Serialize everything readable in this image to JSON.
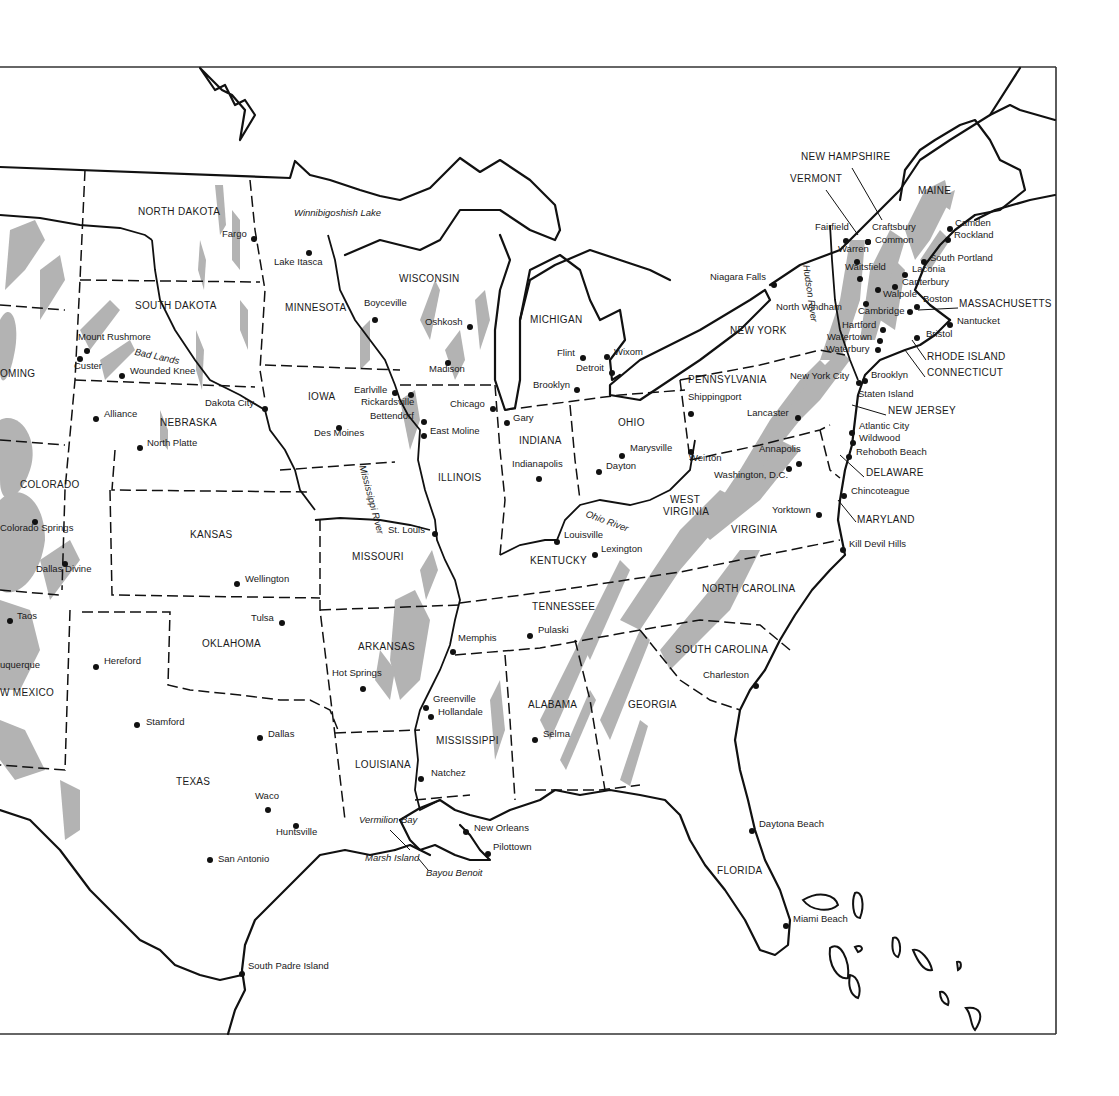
{
  "map": {
    "title_visible": false,
    "colors": {
      "line": "#111111",
      "mountain_shading": "#b3b3b3",
      "background": "#ffffff"
    },
    "states": [
      {
        "name": "NORTH DAKOTA",
        "x": 138,
        "y": 212
      },
      {
        "name": "SOUTH DAKOTA",
        "x": 135,
        "y": 306
      },
      {
        "name": "OMING",
        "x": 0,
        "y": 374
      },
      {
        "name": "NEBRASKA",
        "x": 160,
        "y": 423
      },
      {
        "name": "COLORADO",
        "x": 20,
        "y": 485
      },
      {
        "name": "KANSAS",
        "x": 190,
        "y": 535
      },
      {
        "name": "OKLAHOMA",
        "x": 202,
        "y": 644
      },
      {
        "name": "W MEXICO",
        "x": 0,
        "y": 693
      },
      {
        "name": "TEXAS",
        "x": 176,
        "y": 782
      },
      {
        "name": "MINNESOTA",
        "x": 285,
        "y": 308
      },
      {
        "name": "WISCONSIN",
        "x": 399,
        "y": 279
      },
      {
        "name": "IOWA",
        "x": 308,
        "y": 397
      },
      {
        "name": "ILLINOIS",
        "x": 438,
        "y": 478
      },
      {
        "name": "MISSOURI",
        "x": 352,
        "y": 557
      },
      {
        "name": "ARKANSAS",
        "x": 358,
        "y": 647
      },
      {
        "name": "LOUISIANA",
        "x": 355,
        "y": 765
      },
      {
        "name": "MISSISSIPPI",
        "x": 436,
        "y": 741
      },
      {
        "name": "ALABAMA",
        "x": 528,
        "y": 705
      },
      {
        "name": "TENNESSEE",
        "x": 532,
        "y": 607
      },
      {
        "name": "KENTUCKY",
        "x": 530,
        "y": 561
      },
      {
        "name": "INDIANA",
        "x": 519,
        "y": 441
      },
      {
        "name": "MICHIGAN",
        "x": 530,
        "y": 320
      },
      {
        "name": "OHIO",
        "x": 618,
        "y": 423
      },
      {
        "name": "WEST",
        "x": 670,
        "y": 500
      },
      {
        "name": "VIRGINIA",
        "x": 663,
        "y": 512
      },
      {
        "name": "VIRGINIA",
        "x": 731,
        "y": 530
      },
      {
        "name": "GEORGIA",
        "x": 628,
        "y": 705
      },
      {
        "name": "SOUTH CAROLINA",
        "x": 675,
        "y": 650
      },
      {
        "name": "NORTH CAROLINA",
        "x": 702,
        "y": 589
      },
      {
        "name": "FLORIDA",
        "x": 717,
        "y": 871
      },
      {
        "name": "PENNSYLVANIA",
        "x": 688,
        "y": 380
      },
      {
        "name": "NEW YORK",
        "x": 730,
        "y": 331
      },
      {
        "name": "MAINE",
        "x": 918,
        "y": 191
      },
      {
        "name": "NEW HAMPSHIRE",
        "x": 801,
        "y": 157
      },
      {
        "name": "VERMONT",
        "x": 790,
        "y": 179
      },
      {
        "name": "MASSACHUSETTS",
        "x": 959,
        "y": 304
      },
      {
        "name": "RHODE ISLAND",
        "x": 927,
        "y": 357
      },
      {
        "name": "CONNECTICUT",
        "x": 927,
        "y": 373
      },
      {
        "name": "NEW JERSEY",
        "x": 888,
        "y": 411
      },
      {
        "name": "DELAWARE",
        "x": 866,
        "y": 473
      },
      {
        "name": "MARYLAND",
        "x": 857,
        "y": 520
      }
    ],
    "cities": [
      {
        "name": "Fargo",
        "dx": 254,
        "dy": 239,
        "lx": 222,
        "ly": 234
      },
      {
        "name": "Lake Itasca",
        "dx": 309,
        "dy": 253,
        "lx": 274,
        "ly": 262
      },
      {
        "name": "Mount Rushmore",
        "dx": 87,
        "dy": 351,
        "lx": 78,
        "ly": 337
      },
      {
        "name": "Custer",
        "dx": 80,
        "dy": 359,
        "lx": 74,
        "ly": 366
      },
      {
        "name": "Wounded Knee",
        "dx": 122,
        "dy": 376,
        "lx": 130,
        "ly": 371
      },
      {
        "name": "Alliance",
        "dx": 96,
        "dy": 419,
        "lx": 104,
        "ly": 414
      },
      {
        "name": "North Platte",
        "dx": 140,
        "dy": 448,
        "lx": 147,
        "ly": 443
      },
      {
        "name": "Dakota City",
        "dx": 265,
        "dy": 409,
        "lx": 205,
        "ly": 403
      },
      {
        "name": "Colorado Springs",
        "dx": 35,
        "dy": 522,
        "lx": 0,
        "ly": 528
      },
      {
        "name": "Dallas Divine",
        "dx": 65,
        "dy": 564,
        "lx": 36,
        "ly": 569
      },
      {
        "name": "Wellington",
        "dx": 237,
        "dy": 584,
        "lx": 245,
        "ly": 579
      },
      {
        "name": "Taos",
        "dx": 10,
        "dy": 621,
        "lx": 17,
        "ly": 616
      },
      {
        "name": "uquerque",
        "dx": -20,
        "dy": -20,
        "lx": 0,
        "ly": 665
      },
      {
        "name": "Tulsa",
        "dx": 282,
        "dy": 623,
        "lx": 251,
        "ly": 618
      },
      {
        "name": "Hereford",
        "dx": 96,
        "dy": 667,
        "lx": 104,
        "ly": 661
      },
      {
        "name": "Stamford",
        "dx": 137,
        "dy": 725,
        "lx": 146,
        "ly": 722
      },
      {
        "name": "Dallas",
        "dx": 260,
        "dy": 738,
        "lx": 268,
        "ly": 734
      },
      {
        "name": "Waco",
        "dx": 268,
        "dy": 810,
        "lx": 255,
        "ly": 796
      },
      {
        "name": "Huntsville",
        "dx": 296,
        "dy": 826,
        "lx": 276,
        "ly": 832
      },
      {
        "name": "San Antonio",
        "dx": 210,
        "dy": 860,
        "lx": 218,
        "ly": 859
      },
      {
        "name": "South Padre Island",
        "dx": 242,
        "dy": 974,
        "lx": 248,
        "ly": 966
      },
      {
        "name": "Boyceville",
        "dx": 375,
        "dy": 320,
        "lx": 364,
        "ly": 303
      },
      {
        "name": "Oshkosh",
        "dx": 470,
        "dy": 327,
        "lx": 425,
        "ly": 322
      },
      {
        "name": "Madison",
        "dx": 448,
        "dy": 363,
        "lx": 429,
        "ly": 369
      },
      {
        "name": "Earlville",
        "dx": 395,
        "dy": 393,
        "lx": 354,
        "ly": 390
      },
      {
        "name": "Rickardsville",
        "dx": 411,
        "dy": 395,
        "lx": 361,
        "ly": 402
      },
      {
        "name": "Bettendorf",
        "dx": 424,
        "dy": 422,
        "lx": 370,
        "ly": 416
      },
      {
        "name": "East Moline",
        "dx": 424,
        "dy": 436,
        "lx": 430,
        "ly": 431
      },
      {
        "name": "Des Moines",
        "dx": 339,
        "dy": 428,
        "lx": 314,
        "ly": 433
      },
      {
        "name": "Chicago",
        "dx": 493,
        "dy": 409,
        "lx": 450,
        "ly": 404
      },
      {
        "name": "Gary",
        "dx": 507,
        "dy": 423,
        "lx": 513,
        "ly": 418
      },
      {
        "name": "St. Louis",
        "dx": 435,
        "dy": 534,
        "lx": 388,
        "ly": 530
      },
      {
        "name": "Indianapolis",
        "dx": 539,
        "dy": 479,
        "lx": 512,
        "ly": 464
      },
      {
        "name": "Louisville",
        "dx": 557,
        "dy": 542,
        "lx": 564,
        "ly": 535
      },
      {
        "name": "Lexington",
        "dx": 595,
        "dy": 555,
        "lx": 601,
        "ly": 549
      },
      {
        "name": "Memphis",
        "dx": 453,
        "dy": 652,
        "lx": 458,
        "ly": 638
      },
      {
        "name": "Pulaski",
        "dx": 530,
        "dy": 636,
        "lx": 538,
        "ly": 630
      },
      {
        "name": "Hot Springs",
        "dx": 363,
        "dy": 689,
        "lx": 332,
        "ly": 673
      },
      {
        "name": "Greenville",
        "dx": 426,
        "dy": 708,
        "lx": 433,
        "ly": 699
      },
      {
        "name": "Hollandale",
        "dx": 431,
        "dy": 717,
        "lx": 438,
        "ly": 712
      },
      {
        "name": "Natchez",
        "dx": 421,
        "dy": 779,
        "lx": 431,
        "ly": 773
      },
      {
        "name": "Selma",
        "dx": 535,
        "dy": 740,
        "lx": 543,
        "ly": 734
      },
      {
        "name": "New Orleans",
        "dx": 466,
        "dy": 832,
        "lx": 474,
        "ly": 828
      },
      {
        "name": "Pilottown",
        "dx": 488,
        "dy": 854,
        "lx": 493,
        "ly": 847
      },
      {
        "name": "Flint",
        "dx": 583,
        "dy": 358,
        "lx": 557,
        "ly": 353
      },
      {
        "name": "Wixom",
        "dx": 607,
        "dy": 357,
        "lx": 614,
        "ly": 352
      },
      {
        "name": "Detroit",
        "dx": 612,
        "dy": 373,
        "lx": 576,
        "ly": 368
      },
      {
        "name": "Brooklyn",
        "dx": 577,
        "dy": 390,
        "lx": 533,
        "ly": 385
      },
      {
        "name": "Marysville",
        "dx": 622,
        "dy": 456,
        "lx": 630,
        "ly": 448
      },
      {
        "name": "Dayton",
        "dx": 599,
        "dy": 472,
        "lx": 606,
        "ly": 466
      },
      {
        "name": "Shippingport",
        "dx": 691,
        "dy": 414,
        "lx": 688,
        "ly": 397
      },
      {
        "name": "Weirton",
        "dx": 691,
        "dy": 452,
        "lx": 689,
        "ly": 458
      },
      {
        "name": "Lancaster",
        "dx": 798,
        "dy": 418,
        "lx": 747,
        "ly": 413
      },
      {
        "name": "Annapolis",
        "dx": 799,
        "dy": 464,
        "lx": 759,
        "ly": 449
      },
      {
        "name": "Washington, D.C.",
        "dx": 789,
        "dy": 469,
        "lx": 714,
        "ly": 475
      },
      {
        "name": "Yorktown",
        "dx": 819,
        "dy": 515,
        "lx": 772,
        "ly": 510
      },
      {
        "name": "Kill Devil Hills",
        "dx": 843,
        "dy": 550,
        "lx": 849,
        "ly": 544
      },
      {
        "name": "Charleston",
        "dx": 756,
        "dy": 686,
        "lx": 703,
        "ly": 675
      },
      {
        "name": "Daytona Beach",
        "dx": 752,
        "dy": 831,
        "lx": 759,
        "ly": 824
      },
      {
        "name": "Miami Beach",
        "dx": 786,
        "dy": 926,
        "lx": 793,
        "ly": 919
      },
      {
        "name": "Niagara Falls",
        "dx": 774,
        "dy": 285,
        "lx": 710,
        "ly": 277
      },
      {
        "name": "North Windham",
        "dx": 866,
        "dy": 304,
        "lx": 776,
        "ly": 307
      },
      {
        "name": "Fairfield",
        "dx": 846,
        "dy": 241,
        "lx": 815,
        "ly": 227
      },
      {
        "name": "Craftsbury",
        "dx": 868,
        "dy": 242,
        "lx": 872,
        "ly": 227
      },
      {
        "name": "Common",
        "dx": 868,
        "dy": 242,
        "lx": 875,
        "ly": 240
      },
      {
        "name": "Warren",
        "dx": 857,
        "dy": 262,
        "lx": 838,
        "ly": 249
      },
      {
        "name": "Waitsfield",
        "dx": 860,
        "dy": 279,
        "lx": 845,
        "ly": 267
      },
      {
        "name": "Walpole",
        "dx": 878,
        "dy": 290,
        "lx": 883,
        "ly": 294
      },
      {
        "name": "Cambridge",
        "dx": 910,
        "dy": 312,
        "lx": 858,
        "ly": 311
      },
      {
        "name": "Laconia",
        "dx": 905,
        "dy": 275,
        "lx": 912,
        "ly": 269
      },
      {
        "name": "Canterbury",
        "dx": 895,
        "dy": 287,
        "lx": 902,
        "ly": 282
      },
      {
        "name": "Boston",
        "dx": 917,
        "dy": 307,
        "lx": 923,
        "ly": 299
      },
      {
        "name": "Camden",
        "dx": 950,
        "dy": 229,
        "lx": 955,
        "ly": 223
      },
      {
        "name": "Rockland",
        "dx": 948,
        "dy": 240,
        "lx": 954,
        "ly": 235
      },
      {
        "name": "South Portland",
        "dx": 924,
        "dy": 262,
        "lx": 930,
        "ly": 258
      },
      {
        "name": "Nantucket",
        "dx": 950,
        "dy": 325,
        "lx": 957,
        "ly": 321
      },
      {
        "name": "Hartford",
        "dx": 883,
        "dy": 330,
        "lx": 842,
        "ly": 325
      },
      {
        "name": "Watertown",
        "dx": 880,
        "dy": 341,
        "lx": 827,
        "ly": 337
      },
      {
        "name": "Waterbury",
        "dx": 878,
        "dy": 350,
        "lx": 826,
        "ly": 349
      },
      {
        "name": "Bristol",
        "dx": 917,
        "dy": 338,
        "lx": 926,
        "ly": 334
      },
      {
        "name": "New York City",
        "dx": 859,
        "dy": 383,
        "lx": 790,
        "ly": 376
      },
      {
        "name": "Brooklyn",
        "dx": 865,
        "dy": 381,
        "lx": 871,
        "ly": 375
      },
      {
        "name": "Staten Island",
        "dx": -20,
        "dy": -20,
        "lx": 858,
        "ly": 394
      },
      {
        "name": "Atlantic City",
        "dx": 852,
        "dy": 433,
        "lx": 859,
        "ly": 426
      },
      {
        "name": "Wildwood",
        "dx": 853,
        "dy": 443,
        "lx": 859,
        "ly": 438
      },
      {
        "name": "Rehoboth Beach",
        "dx": 849,
        "dy": 457,
        "lx": 856,
        "ly": 452
      },
      {
        "name": "Chincoteague",
        "dx": 844,
        "dy": 496,
        "lx": 851,
        "ly": 491
      }
    ],
    "features": [
      {
        "name": "Winnibigoshish Lake",
        "x": 294,
        "y": 213,
        "rot": 0
      },
      {
        "name": "Bad Lands",
        "x": 136,
        "y": 352,
        "rot": 12
      },
      {
        "name": "Mississippi River",
        "x": 368,
        "y": 470,
        "rot": 75
      },
      {
        "name": "Ohio River",
        "x": 588,
        "y": 514,
        "rot": 20
      },
      {
        "name": "Hudson River",
        "x": 812,
        "y": 270,
        "rot": 82
      },
      {
        "name": "Vermilion Bay",
        "x": 359,
        "y": 820,
        "rot": 0
      },
      {
        "name": "Marsh Island",
        "x": 365,
        "y": 858,
        "rot": 0
      },
      {
        "name": "Bayou Benoit",
        "x": 426,
        "y": 873,
        "rot": 0
      }
    ]
  }
}
